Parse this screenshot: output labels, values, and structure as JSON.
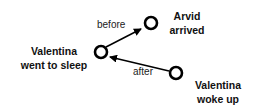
{
  "nodes": [
    {
      "id": "arvid_arrived",
      "line1": "Arvid",
      "line2": "arrived"
    },
    {
      "id": "valentina_sleep",
      "line1": "Valentina",
      "line2": "went to sleep"
    },
    {
      "id": "valentina_woke",
      "line1": "Valentina",
      "line2": "woke up"
    }
  ],
  "edges": [
    {
      "from": "valentina_sleep",
      "to": "arvid_arrived",
      "label": "before"
    },
    {
      "from": "valentina_woke",
      "to": "valentina_sleep",
      "label": "after"
    }
  ],
  "colors": {
    "stroke": "#000000",
    "text": "#111111"
  }
}
